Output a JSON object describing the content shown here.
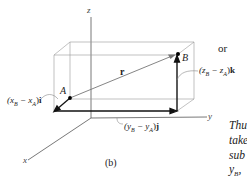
{
  "figure": {
    "caption": "(b)",
    "axes": {
      "x": "x",
      "y": "y",
      "z": "z"
    },
    "points": {
      "A": "A",
      "B": "B"
    },
    "vector_label": "r",
    "components": {
      "i": "(x_B − x_A)i",
      "i_parts": {
        "open": "(x",
        "sub1": "B",
        "minus": " − x",
        "sub2": "A",
        "close": ")",
        "unit": "i"
      },
      "j_parts": {
        "open": "(y",
        "sub1": "B",
        "minus": " − y",
        "sub2": "A",
        "close": ")",
        "unit": "j"
      },
      "k_parts": {
        "open": "(z",
        "sub1": "B",
        "minus": " − z",
        "sub2": "A",
        "close": ")",
        "unit": "k"
      }
    }
  },
  "side_text": {
    "or": "or",
    "line1": "Thu",
    "line2": "take",
    "line3": "sub",
    "line4": "y",
    "line4_sub": "B",
    "line4_tail": ","
  }
}
